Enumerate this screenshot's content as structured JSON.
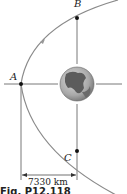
{
  "labels": {
    "point_a": "A",
    "point_b": "B",
    "point_c": "C"
  },
  "dimension": {
    "distance": "7330 km"
  },
  "caption": "Fig. P12.118",
  "colors": {
    "orbit": "#8a8a8a",
    "axis": "#444444",
    "earth_land": "#5a5a5a",
    "earth_ocean": "#bdbdbd"
  }
}
